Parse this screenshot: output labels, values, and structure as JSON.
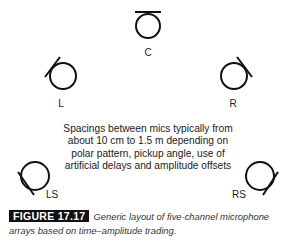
{
  "figure": {
    "microphones": [
      {
        "id": "C",
        "label": "C"
      },
      {
        "id": "L",
        "label": "L"
      },
      {
        "id": "R",
        "label": "R"
      },
      {
        "id": "LS",
        "label": "LS"
      },
      {
        "id": "RS",
        "label": "RS"
      }
    ],
    "note": "Spacings between mics typically from about 10 cm to 1.5 m depending on polar pattern, pickup angle, use of artificial delays and amplitude offsets",
    "caption": {
      "tag": "FIGURE 17.17",
      "text": "Generic layout of five-channel microphone arrays based on time–amplitude trading."
    },
    "colors": {
      "stroke": "#111111",
      "tag_bg": "#111111",
      "tag_fg": "#ffffff"
    }
  }
}
